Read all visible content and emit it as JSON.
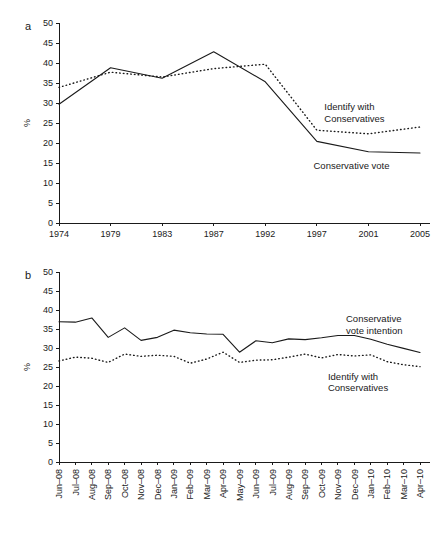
{
  "figure": {
    "background": "#ffffff",
    "ink": "#1a1a1a"
  },
  "panel_a": {
    "letter": "a",
    "ylabel": "%"
  },
  "panel_b": {
    "letter": "b",
    "ylabel": "%"
  },
  "chart_data": [
    {
      "panel": "a",
      "type": "line",
      "title": "",
      "xlabel": "",
      "ylabel": "%",
      "ylim": [
        0,
        50
      ],
      "ytick_step": 5,
      "yticks": [
        0,
        5,
        10,
        15,
        20,
        25,
        30,
        35,
        40,
        45,
        50
      ],
      "grid": false,
      "legend_position": "inline-annotation",
      "categories": [
        "1974",
        "1979",
        "1983",
        "1987",
        "1992",
        "1997",
        "2001",
        "2005"
      ],
      "series": [
        {
          "name": "Conservative vote",
          "style": "solid",
          "values": [
            29.7,
            38.8,
            36.2,
            42.8,
            35.3,
            20.4,
            17.8,
            17.5
          ]
        },
        {
          "name": "Identify with Conservatives",
          "style": "dotted",
          "values": [
            33.9,
            37.7,
            36.5,
            38.6,
            39.7,
            23.2,
            22.3,
            24.0
          ]
        }
      ],
      "annotations": [
        {
          "text_lines": [
            "Identify with",
            "Conservatives"
          ],
          "x": 0.735,
          "y": 0.565
        },
        {
          "text_lines": [
            "Conservative vote"
          ],
          "x": 0.705,
          "y": 0.272
        }
      ]
    },
    {
      "panel": "b",
      "type": "line",
      "title": "",
      "xlabel": "",
      "ylabel": "%",
      "ylim": [
        0,
        50
      ],
      "ytick_step": 5,
      "yticks": [
        0,
        5,
        10,
        15,
        20,
        25,
        30,
        35,
        40,
        45,
        50
      ],
      "grid": false,
      "legend_position": "inline-annotation",
      "categories": [
        "Jun–08",
        "Jul–08",
        "Aug–08",
        "Sep–08",
        "Oct–08",
        "Nov–08",
        "Dec–08",
        "Jan–09",
        "Feb–09",
        "Mar–09",
        "Apr–09",
        "May–09",
        "Jun–09",
        "Jul–09",
        "Aug–09",
        "Sep–09",
        "Oct–09",
        "Nov–09",
        "Dec–09",
        "Jan–10",
        "Feb–10",
        "Mar–10",
        "Apr–10"
      ],
      "series": [
        {
          "name": "Conservative vote intention",
          "style": "solid",
          "values": [
            36.9,
            36.8,
            37.9,
            32.8,
            35.3,
            32.0,
            32.8,
            34.7,
            34.0,
            33.7,
            33.6,
            28.9,
            31.9,
            31.4,
            32.4,
            32.2,
            32.7,
            33.3,
            33.3,
            32.3,
            31.0,
            29.9,
            28.8
          ]
        },
        {
          "name": "Identify with Conservatives",
          "style": "dotted",
          "values": [
            26.6,
            27.6,
            27.3,
            26.2,
            28.4,
            27.8,
            28.1,
            27.8,
            26.0,
            27.1,
            28.9,
            26.2,
            26.8,
            26.9,
            27.6,
            28.4,
            27.4,
            28.3,
            27.9,
            28.2,
            26.4,
            25.6,
            25.1
          ]
        }
      ],
      "annotations": [
        {
          "text_lines": [
            "Conservative",
            "vote intention"
          ],
          "x": 0.795,
          "y": 0.735
        },
        {
          "text_lines": [
            "Identify with",
            "Conservatives"
          ],
          "x": 0.745,
          "y": 0.432
        }
      ]
    }
  ]
}
